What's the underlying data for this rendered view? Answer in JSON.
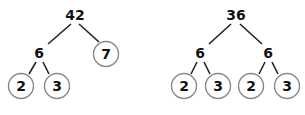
{
  "diagrams": [
    {
      "name": "factor-tree-42",
      "root": "42",
      "level1": [
        "6",
        "7"
      ],
      "level2": [
        "2",
        "3"
      ],
      "prime_leaves": [
        "7",
        "2",
        "3"
      ]
    },
    {
      "name": "factor-tree-36",
      "root": "36",
      "level1": [
        "6",
        "6"
      ],
      "level2": [
        "2",
        "3",
        "2",
        "3"
      ],
      "prime_leaves": [
        "2",
        "3",
        "2",
        "3"
      ]
    }
  ]
}
